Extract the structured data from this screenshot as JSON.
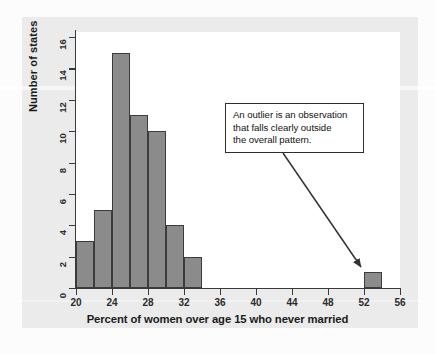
{
  "chart_data": {
    "type": "bar",
    "title": "",
    "subtitle": "",
    "xlabel": "Percent of women over age 15 who never married",
    "ylabel": "Number of states",
    "xlim": [
      20,
      56
    ],
    "ylim": [
      0,
      16
    ],
    "grid": false,
    "legend": null,
    "bin_width": 2,
    "categories": [
      "20-22",
      "22-24",
      "24-26",
      "26-28",
      "28-30",
      "30-32",
      "32-34",
      "52-54"
    ],
    "bins": [
      {
        "start": 20,
        "end": 22,
        "count": 3
      },
      {
        "start": 22,
        "end": 24,
        "count": 5
      },
      {
        "start": 24,
        "end": 26,
        "count": 15
      },
      {
        "start": 26,
        "end": 28,
        "count": 11
      },
      {
        "start": 28,
        "end": 30,
        "count": 10
      },
      {
        "start": 30,
        "end": 32,
        "count": 4
      },
      {
        "start": 32,
        "end": 34,
        "count": 2
      },
      {
        "start": 52,
        "end": 54,
        "count": 1
      }
    ],
    "values": [
      3,
      5,
      15,
      11,
      10,
      4,
      2,
      1
    ],
    "x_ticks": [
      20,
      24,
      28,
      32,
      36,
      40,
      44,
      48,
      52,
      56
    ],
    "y_ticks": [
      0,
      2,
      4,
      6,
      8,
      10,
      12,
      14,
      16
    ],
    "bar_fill_color": "#8b8b8b",
    "bar_edge_color": "#3c3c3c",
    "annotations": [
      {
        "text": "An outlier is an observation that falls clearly outside the overall pattern.",
        "lines": [
          "An outlier is an observation",
          "that falls clearly outside",
          "the overall pattern."
        ],
        "points_to_bin": "52-54"
      }
    ]
  },
  "axes": {
    "x_title": "Percent of women over age 15 who never married",
    "y_title": "Number of states",
    "x_tick_labels": [
      "20",
      "24",
      "28",
      "32",
      "36",
      "40",
      "44",
      "48",
      "52",
      "56"
    ],
    "y_tick_labels": [
      "0",
      "2",
      "4",
      "6",
      "8",
      "10",
      "12",
      "14",
      "16"
    ]
  },
  "callout": {
    "line1": "An outlier is an observation",
    "line2": "that falls clearly outside",
    "line3": "the overall pattern."
  }
}
